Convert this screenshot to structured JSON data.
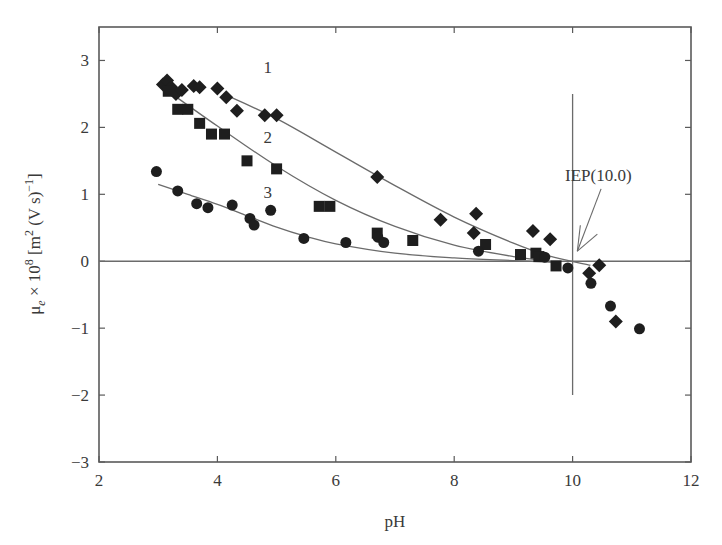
{
  "chart_data": {
    "type": "scatter",
    "title": "",
    "xlabel": "pH",
    "ylabel": "μe × 10⁸ [m² (V s)⁻¹]",
    "ylabel_parts": {
      "sym": "μ",
      "sub": "e",
      "times": " × 10",
      "exp": "8",
      "unit_a": " [m",
      "unit_exp": "2",
      "unit_b": " (V s)",
      "unit_exp2": "−1",
      "unit_c": "]"
    },
    "xlim": [
      2,
      12
    ],
    "ylim": [
      -3,
      3.5
    ],
    "xticks": [
      2,
      4,
      6,
      8,
      10,
      12
    ],
    "xtick_labels": [
      "2",
      "4",
      "6",
      "8",
      "10",
      "12"
    ],
    "yticks": [
      -3,
      -2,
      -1,
      0,
      1,
      2,
      3
    ],
    "ytick_labels": [
      "−3",
      "−2",
      "−1",
      "0",
      "1",
      "2",
      "3"
    ],
    "grid": false,
    "legend": "none (series labelled inline 1, 2, 3)",
    "zero_line": 0,
    "iep_line": {
      "x": 10.0,
      "y_from": -2.0,
      "y_to": 2.5
    },
    "annotations": [
      {
        "text": "1",
        "x": 4.85,
        "y": 2.82
      },
      {
        "text": "2",
        "x": 4.85,
        "y": 1.76
      },
      {
        "text": "3",
        "x": 4.85,
        "y": 0.95
      },
      {
        "text": "IEP(10.0)",
        "x": 10.65,
        "y": 1.2,
        "arrow_to": [
          10.08,
          0.15
        ]
      }
    ],
    "series": [
      {
        "name": "1",
        "marker": "diamond",
        "x": [
          3.08,
          3.15,
          3.22,
          3.3,
          3.4,
          3.6,
          3.7,
          4.0,
          4.15,
          4.33,
          4.8,
          5.0,
          6.7,
          7.77,
          8.33,
          8.37,
          9.33,
          9.62,
          10.28,
          10.45,
          10.73
        ],
        "y": [
          2.64,
          2.7,
          2.6,
          2.5,
          2.56,
          2.62,
          2.6,
          2.58,
          2.45,
          2.25,
          2.18,
          2.18,
          1.26,
          0.62,
          0.42,
          0.71,
          0.45,
          0.33,
          -0.18,
          -0.06,
          -0.9
        ],
        "fit_x": [
          4.1,
          5,
          6,
          7,
          8,
          9,
          9.6,
          10.3
        ],
        "fit_y": [
          2.5,
          2.13,
          1.63,
          1.13,
          0.66,
          0.27,
          0.08,
          -0.06
        ]
      },
      {
        "name": "2",
        "marker": "square",
        "x": [
          3.17,
          3.33,
          3.5,
          3.7,
          3.9,
          4.12,
          4.5,
          5.0,
          5.72,
          5.9,
          6.7,
          7.3,
          8.53,
          9.12,
          9.38,
          9.43,
          9.72
        ],
        "y": [
          2.54,
          2.27,
          2.27,
          2.06,
          1.9,
          1.9,
          1.5,
          1.38,
          0.82,
          0.82,
          0.42,
          0.31,
          0.25,
          0.1,
          0.12,
          0.07,
          -0.07
        ],
        "fit_x": [
          3.2,
          4,
          5,
          6,
          7,
          8,
          9,
          9.8
        ],
        "fit_y": [
          2.52,
          2.02,
          1.42,
          0.91,
          0.52,
          0.24,
          0.07,
          -0.02
        ]
      },
      {
        "name": "3",
        "marker": "circle",
        "x": [
          2.97,
          3.33,
          3.65,
          3.84,
          4.25,
          4.55,
          4.62,
          4.9,
          5.46,
          6.17,
          6.71,
          6.81,
          8.41,
          9.53,
          9.92,
          10.31,
          10.64,
          11.13
        ],
        "y": [
          1.34,
          1.05,
          0.86,
          0.8,
          0.84,
          0.64,
          0.54,
          0.76,
          0.34,
          0.28,
          0.36,
          0.28,
          0.15,
          0.06,
          -0.1,
          -0.33,
          -0.67,
          -1.01
        ],
        "fit_x": [
          3.0,
          3.5,
          4,
          4.5,
          5,
          5.5,
          6,
          7,
          8,
          9,
          9.8
        ],
        "fit_y": [
          1.15,
          1.0,
          0.85,
          0.68,
          0.51,
          0.37,
          0.26,
          0.12,
          0.05,
          0.01,
          -0.02
        ]
      }
    ]
  },
  "colors": {
    "axis": "#5a5a5a",
    "marker": "#1e1e1e",
    "line": "#6b6b6b",
    "text": "#3a3a3a"
  }
}
